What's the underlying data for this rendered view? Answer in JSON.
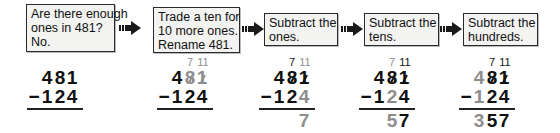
{
  "steps": [
    {
      "lines": [
        "Are there enough",
        "ones in 481?",
        "No."
      ]
    },
    {
      "lines": [
        "Trade a ten for",
        "10 more ones.",
        "Rename 481."
      ]
    },
    {
      "lines": [
        "Subtract the",
        "ones."
      ]
    },
    {
      "lines": [
        "Subtract the",
        "tens."
      ]
    },
    {
      "lines": [
        "Subtract the",
        "hundreds."
      ]
    }
  ],
  "arrow_icon": "right-arrow-icon",
  "colors": {
    "text": "#111111",
    "highlight_gray": "#8e8e8e",
    "box_background": "#f3f3f1",
    "box_border": "#2a2a2a"
  },
  "problems": [
    {
      "regroup": null,
      "minuend": [
        "4",
        "8",
        "1"
      ],
      "operator": "−",
      "subtrahend": [
        "1",
        "2",
        "4"
      ],
      "result": [
        "",
        "",
        ""
      ]
    },
    {
      "regroup": {
        "tens": "7",
        "ones": "11"
      },
      "minuend": [
        "4",
        "8",
        "1"
      ],
      "operator": "−",
      "subtrahend": [
        "1",
        "2",
        "4"
      ],
      "result": [
        "",
        "",
        ""
      ]
    },
    {
      "regroup": {
        "tens": "7",
        "ones": "11"
      },
      "minuend": [
        "4",
        "8",
        "1"
      ],
      "operator": "−",
      "subtrahend": [
        "1",
        "2",
        "4"
      ],
      "result": [
        "",
        "",
        "7"
      ]
    },
    {
      "regroup": {
        "tens": "7",
        "ones": "11"
      },
      "minuend": [
        "4",
        "8",
        "1"
      ],
      "operator": "−",
      "subtrahend": [
        "1",
        "2",
        "4"
      ],
      "result": [
        "",
        "5",
        "7"
      ]
    },
    {
      "regroup": {
        "tens": "7",
        "ones": "11"
      },
      "minuend": [
        "4",
        "8",
        "1"
      ],
      "operator": "−",
      "subtrahend": [
        "1",
        "2",
        "4"
      ],
      "result": [
        "3",
        "5",
        "7"
      ]
    }
  ]
}
